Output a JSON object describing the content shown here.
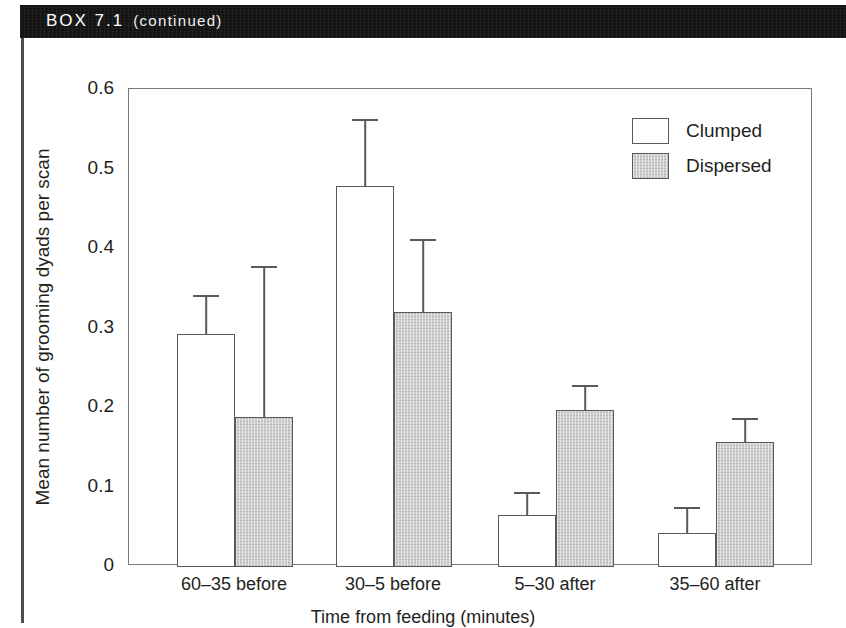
{
  "box": {
    "title": "BOX 7.1",
    "subtitle": "(continued)"
  },
  "chart_data": {
    "type": "bar",
    "title": "",
    "xlabel": "Time from feeding (minutes)",
    "ylabel": "Mean number of grooming dyads per scan",
    "categories": [
      "60–35 before",
      "30–5 before",
      "5–30 after",
      "35–60 after"
    ],
    "ylim": [
      0,
      0.6
    ],
    "yticks": [
      0,
      0.1,
      0.2,
      0.3,
      0.4,
      0.5,
      0.6
    ],
    "ytick_labels": [
      "0",
      "0.1",
      "0.2",
      "0.3",
      "0.4",
      "0.5",
      "0.6"
    ],
    "grid": false,
    "legend_position": "top-right",
    "series": [
      {
        "name": "Clumped",
        "color": "#ffffff",
        "values": [
          0.292,
          0.478,
          0.064,
          0.042
        ],
        "errors_upper": [
          0.341,
          0.562,
          0.093,
          0.074
        ]
      },
      {
        "name": "Dispersed",
        "color": "#cdcdcd",
        "values": [
          0.188,
          0.319,
          0.196,
          0.156
        ],
        "errors_upper": [
          0.377,
          0.411,
          0.228,
          0.186
        ]
      }
    ]
  }
}
